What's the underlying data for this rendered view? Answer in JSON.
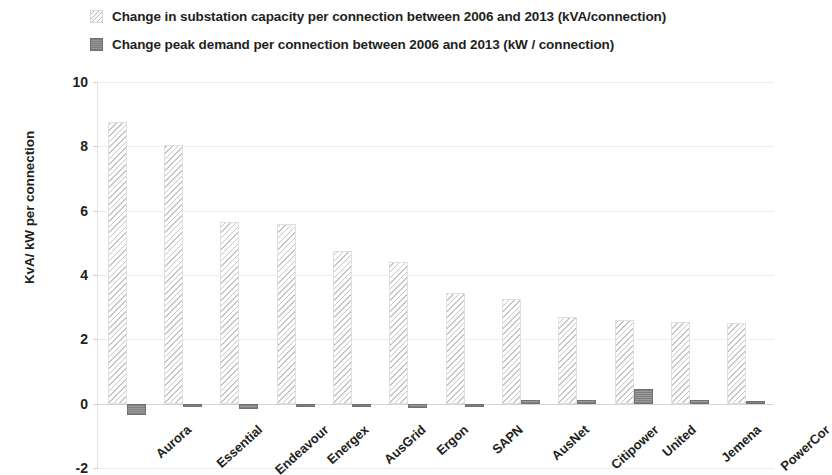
{
  "legend": {
    "position": "top-left",
    "items": [
      {
        "swatch": "hatched-light-gray",
        "label": "Change in substation capacity per connection between 2006 and 2013 (kVA/connection)"
      },
      {
        "swatch": "solid-gray",
        "label": "Change peak demand per connection between 2006 and 2013 (kW / connection)"
      }
    ]
  },
  "axes": {
    "y_title": "KvA/ kW per connection",
    "y_ticks": [
      "10",
      "8",
      "6",
      "4",
      "2",
      "0",
      "-2"
    ]
  },
  "colors": {
    "capacity_hatch": "#c6c6c6",
    "demand_fill": "#8d8d8d",
    "gridline": "#ededed",
    "text": "#231f20",
    "background": "#ffffff"
  },
  "chart_data": {
    "type": "bar",
    "title": "",
    "xlabel": "",
    "ylabel": "KvA/ kW per connection",
    "ylim": [
      -2,
      10
    ],
    "ytick_values": [
      10,
      8,
      6,
      4,
      2,
      0,
      -2
    ],
    "grid": true,
    "legend_position": "top-left",
    "categories": [
      "Aurora",
      "Essential",
      "Endeavour",
      "Energex",
      "AusGrid",
      "Ergon",
      "SAPN",
      "AusNet",
      "Citipower",
      "United",
      "Jemena",
      "PowerCor"
    ],
    "series": [
      {
        "name": "Change in substation capacity per connection between 2006 and 2013 (kVA/connection)",
        "values": [
          8.75,
          8.05,
          5.65,
          5.6,
          4.75,
          4.4,
          3.45,
          3.25,
          2.7,
          2.6,
          2.55,
          2.5
        ]
      },
      {
        "name": "Change peak demand per connection between 2006 and 2013 (kW / connection)",
        "values": [
          -0.35,
          -0.1,
          -0.15,
          -0.08,
          -0.08,
          -0.12,
          -0.1,
          0.1,
          0.1,
          0.45,
          0.1,
          0.03
        ]
      }
    ]
  }
}
